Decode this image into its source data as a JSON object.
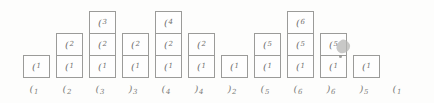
{
  "figure": {
    "type": "stack-evolution-diagram",
    "colors": {
      "background": "#fdfdfc",
      "box_border": "#9b9b99",
      "box_fill": "#fefefe",
      "box_text": "#70706e",
      "token_text": "#7d7d7b",
      "smudge": "#b6b6b4"
    },
    "columns": [
      {
        "stack": [
          {
            "glyph": "(",
            "sub": "1"
          }
        ]
      },
      {
        "stack": [
          {
            "glyph": "(",
            "sub": "2"
          },
          {
            "glyph": "(",
            "sub": "1"
          }
        ]
      },
      {
        "stack": [
          {
            "glyph": "(",
            "sub": "3"
          },
          {
            "glyph": "(",
            "sub": "2"
          },
          {
            "glyph": "(",
            "sub": "1"
          }
        ]
      },
      {
        "stack": [
          {
            "glyph": "(",
            "sub": "2"
          },
          {
            "glyph": "(",
            "sub": "1"
          }
        ]
      },
      {
        "stack": [
          {
            "glyph": "(",
            "sub": "4"
          },
          {
            "glyph": "(",
            "sub": "2"
          },
          {
            "glyph": "(",
            "sub": "1"
          }
        ]
      },
      {
        "stack": [
          {
            "glyph": "(",
            "sub": "2"
          },
          {
            "glyph": "(",
            "sub": "1"
          }
        ]
      },
      {
        "stack": [
          {
            "glyph": "(",
            "sub": "1"
          }
        ]
      },
      {
        "stack": [
          {
            "glyph": "(",
            "sub": "5"
          },
          {
            "glyph": "(",
            "sub": "1"
          }
        ]
      },
      {
        "stack": [
          {
            "glyph": "(",
            "sub": "6"
          },
          {
            "glyph": "(",
            "sub": "5"
          },
          {
            "glyph": "(",
            "sub": "1"
          }
        ]
      },
      {
        "stack": [
          {
            "glyph": "(",
            "sub": "5"
          },
          {
            "glyph": "(",
            "sub": "1"
          }
        ]
      },
      {
        "stack": [
          {
            "glyph": "(",
            "sub": "1"
          }
        ]
      },
      {
        "stack": []
      }
    ],
    "sequence": [
      {
        "glyph": "(",
        "sub": "1"
      },
      {
        "glyph": "(",
        "sub": "2"
      },
      {
        "glyph": "(",
        "sub": "3"
      },
      {
        "glyph": ")",
        "sub": "3"
      },
      {
        "glyph": "(",
        "sub": "4"
      },
      {
        "glyph": ")",
        "sub": "4"
      },
      {
        "glyph": ")",
        "sub": "2"
      },
      {
        "glyph": "(",
        "sub": "5"
      },
      {
        "glyph": "(",
        "sub": "6"
      },
      {
        "glyph": ")",
        "sub": "6"
      },
      {
        "glyph": ")",
        "sub": "5"
      },
      {
        "glyph": "(",
        "sub": "1"
      }
    ]
  }
}
